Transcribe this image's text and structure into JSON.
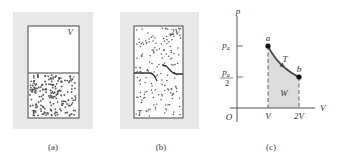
{
  "panels": {
    "a": {
      "caption": "(a)",
      "top_label": "V",
      "gas_label": "V",
      "temp_label": "T"
    },
    "b": {
      "caption": "(b)",
      "volume_label": "2V",
      "temp_label": "T"
    },
    "c": {
      "caption": "(c)",
      "y_axis_label": "p",
      "x_axis_label": "V",
      "origin_label": "O",
      "y_tick_pa": "p",
      "y_tick_pa_sub": "a",
      "y_tick_half_num": "p",
      "y_tick_half_sub": "a",
      "y_tick_half_den": "2",
      "x_tick_v": "V",
      "x_tick_2v": "2V",
      "point_a_label": "a",
      "point_b_label": "b",
      "curve_label": "T",
      "area_label": "W"
    }
  },
  "colors": {
    "stipple": "#b9b9b9",
    "dots": "#555555",
    "area_fill": "#dcdcdc",
    "line": "#444444"
  },
  "chart_data": {
    "type": "line",
    "title": "",
    "xlabel": "V",
    "ylabel": "p",
    "x_tick_labels": [
      "V",
      "2V"
    ],
    "y_tick_labels": [
      "p_a",
      "p_a/2"
    ],
    "xlim": [
      0,
      2.5
    ],
    "ylim": [
      0,
      1.4
    ],
    "series": [
      {
        "name": "isotherm T",
        "x": [
          1,
          1.25,
          1.5,
          1.75,
          2
        ],
        "y": [
          1,
          0.8,
          0.667,
          0.571,
          0.5
        ]
      }
    ],
    "points": [
      {
        "label": "a",
        "x": 1,
        "y": 1
      },
      {
        "label": "b",
        "x": 2,
        "y": 0.5
      }
    ],
    "shaded_region": {
      "label": "W",
      "x_from": 1,
      "x_to": 2
    },
    "grid": false
  }
}
